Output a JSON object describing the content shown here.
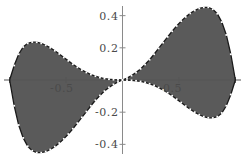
{
  "chart_data": {
    "type": "area",
    "title": "",
    "subtitle": "",
    "xlabel": "",
    "ylabel": "",
    "xlim": [
      -1.05,
      1.05
    ],
    "ylim": [
      -0.46,
      0.46
    ],
    "grid": false,
    "legend": null,
    "style": {
      "fill_color": "#5a5a5a",
      "curve_color": "#1a1a1a",
      "marker_color": "#ffffff",
      "axis_color": "#555555",
      "label_color": "#4a4a4a",
      "background": "#ffffff"
    },
    "x_ticks": [
      {
        "value": -1.0,
        "label": ""
      },
      {
        "value": -0.5,
        "label": "-0.5"
      },
      {
        "value": 0.5,
        "label": "0.5"
      },
      {
        "value": 1.0,
        "label": ""
      }
    ],
    "y_ticks": [
      {
        "value": 0.4,
        "label": "0.4"
      },
      {
        "value": 0.2,
        "label": "0.2"
      },
      {
        "value": -0.2,
        "label": "-0.2"
      },
      {
        "value": -0.4,
        "label": "-0.4"
      }
    ],
    "series": [
      {
        "name": "curve",
        "x": [
          -1.0,
          -0.96,
          -0.92,
          -0.88,
          -0.84,
          -0.8,
          -0.76,
          -0.72,
          -0.68,
          -0.64,
          -0.6,
          -0.56,
          -0.52,
          -0.48,
          -0.44,
          -0.4,
          -0.36,
          -0.32,
          -0.28,
          -0.24,
          -0.2,
          -0.16,
          -0.12,
          -0.08,
          -0.04,
          0.0,
          0.04,
          0.08,
          0.12,
          0.16,
          0.2,
          0.24,
          0.28,
          0.32,
          0.36,
          0.4,
          0.44,
          0.48,
          0.52,
          0.56,
          0.6,
          0.64,
          0.68,
          0.72,
          0.76,
          0.8,
          0.84,
          0.88,
          0.92,
          0.96,
          1.0
        ],
        "y": [
          0.0,
          0.09,
          0.16,
          0.205,
          0.228,
          0.236,
          0.235,
          0.228,
          0.216,
          0.2,
          0.182,
          0.162,
          0.14,
          0.119,
          0.098,
          0.079,
          0.062,
          0.047,
          0.034,
          0.024,
          0.015,
          0.009,
          0.005,
          0.002,
          0.001,
          0.0,
          -0.001,
          -0.002,
          -0.005,
          -0.009,
          -0.015,
          -0.024,
          -0.034,
          -0.047,
          -0.062,
          -0.079,
          -0.098,
          -0.119,
          -0.14,
          -0.162,
          -0.182,
          -0.2,
          -0.216,
          -0.228,
          -0.235,
          -0.236,
          -0.228,
          -0.205,
          -0.16,
          -0.09,
          0.0
        ]
      },
      {
        "name": "curve-mirror",
        "x": [
          -1.0,
          -0.96,
          -0.92,
          -0.88,
          -0.84,
          -0.8,
          -0.76,
          -0.72,
          -0.68,
          -0.64,
          -0.6,
          -0.56,
          -0.52,
          -0.48,
          -0.44,
          -0.4,
          -0.36,
          -0.32,
          -0.28,
          -0.24,
          -0.2,
          -0.16,
          -0.12,
          -0.08,
          -0.04,
          0.0,
          0.04,
          0.08,
          0.12,
          0.16,
          0.2,
          0.24,
          0.28,
          0.32,
          0.36,
          0.4,
          0.44,
          0.48,
          0.52,
          0.56,
          0.6,
          0.64,
          0.68,
          0.72,
          0.76,
          0.8,
          0.84,
          0.88,
          0.92,
          0.96,
          1.0
        ],
        "y": [
          0.0,
          -0.16,
          -0.28,
          -0.36,
          -0.412,
          -0.44,
          -0.452,
          -0.452,
          -0.445,
          -0.432,
          -0.414,
          -0.392,
          -0.366,
          -0.336,
          -0.303,
          -0.268,
          -0.232,
          -0.196,
          -0.16,
          -0.126,
          -0.096,
          -0.069,
          -0.046,
          -0.027,
          -0.012,
          0.0,
          0.012,
          0.027,
          0.046,
          0.069,
          0.096,
          0.126,
          0.16,
          0.196,
          0.232,
          0.268,
          0.303,
          0.336,
          0.366,
          0.392,
          0.414,
          0.432,
          0.445,
          0.452,
          0.452,
          0.44,
          0.412,
          0.36,
          0.28,
          0.16,
          0.0
        ]
      }
    ]
  }
}
